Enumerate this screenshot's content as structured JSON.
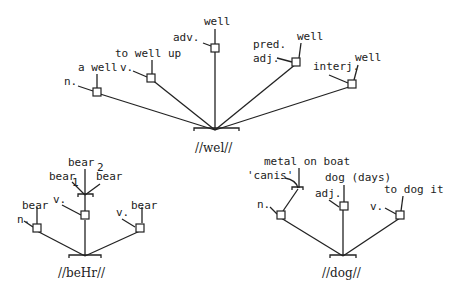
{
  "trees": {
    "wel": {
      "root_label": "//wel//",
      "branches": [
        {
          "pos": "n.",
          "gloss": "a well"
        },
        {
          "pos": "v.",
          "gloss": "to well up"
        },
        {
          "pos": "adv.",
          "gloss": "well"
        },
        {
          "pos": "pred.",
          "pos2": "adj.",
          "gloss": "well"
        },
        {
          "pos": "interj.",
          "gloss": "well"
        }
      ]
    },
    "beHr": {
      "root_label": "//beHr//",
      "branches": [
        {
          "pos": "n.",
          "gloss": "bear"
        },
        {
          "pos": "v.",
          "gloss": "bear",
          "sub_glosses": [
            "bear",
            "1",
            "bear",
            "2",
            "bear"
          ]
        },
        {
          "pos": "v.",
          "gloss": "bear"
        }
      ]
    },
    "dog": {
      "root_label": "//dog//",
      "branches": [
        {
          "pos": "n.",
          "sub_glosses": [
            "'canis'",
            "metal on boat"
          ]
        },
        {
          "pos": "adj.",
          "gloss": "dog (days)"
        },
        {
          "pos": "v.",
          "gloss": "to dog it"
        }
      ]
    }
  }
}
